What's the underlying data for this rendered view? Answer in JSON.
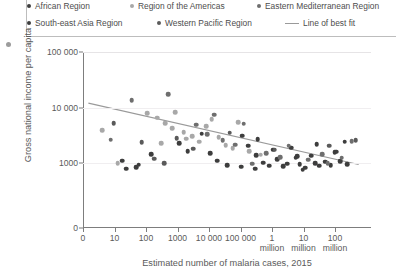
{
  "legend": {
    "items": [
      {
        "label": "African Region",
        "marker": "dot",
        "color": "#3d3d3d",
        "row": 0,
        "x": 0
      },
      {
        "label": "Region of the Americas",
        "marker": "dot",
        "color": "#a8a8a8",
        "row": 0,
        "x": 103
      },
      {
        "label": "Eastern Mediterranean Region",
        "marker": "dot",
        "color": "#6e6e6e",
        "row": 0,
        "x": 230
      },
      {
        "label": "South-east Asia Region",
        "marker": "dot",
        "color": "#3d3d3d",
        "row": 1,
        "x": 0
      },
      {
        "label": "Western Pacific Region",
        "marker": "dot",
        "color": "#5a5a5a",
        "row": 1,
        "x": 130
      },
      {
        "label": "Line of best fit",
        "marker": "line",
        "color": "#9a9a9a",
        "row": 1,
        "x": 258
      }
    ]
  },
  "chart_data": {
    "type": "scatter",
    "title": "",
    "xlabel": "Estimated number of malaria cases, 2015",
    "ylabel": "Gross national income per capita",
    "x_scale": "log",
    "y_scale": "log",
    "grid": true,
    "legend_position": "top",
    "x_ticks": [
      {
        "value": 0,
        "label": "0",
        "label2": ""
      },
      {
        "value": 10,
        "label": "10",
        "label2": ""
      },
      {
        "value": 100,
        "label": "100",
        "label2": ""
      },
      {
        "value": 1000,
        "label": "1000",
        "label2": ""
      },
      {
        "value": 10000,
        "label": "10 000",
        "label2": ""
      },
      {
        "value": 100000,
        "label": "100 000",
        "label2": ""
      },
      {
        "value": 1000000,
        "label": "1",
        "label2": "million"
      },
      {
        "value": 10000000,
        "label": "10",
        "label2": "million"
      },
      {
        "value": 100000000,
        "label": "100",
        "label2": "million"
      }
    ],
    "y_ticks": [
      {
        "value": 100000,
        "label": "100 000"
      },
      {
        "value": 10000,
        "label": "10 000"
      },
      {
        "value": 1000,
        "label": "1000"
      },
      {
        "value": 0,
        "label": "0"
      }
    ],
    "xlim": [
      0,
      100000000
    ],
    "ylim": [
      0,
      100000
    ],
    "line_of_best_fit": {
      "x0": 0.5,
      "y0": 12000,
      "x1": 97,
      "y1": 820,
      "color": "#9a9a9a"
    },
    "series": [
      {
        "name": "African Region",
        "color": "#3d3d3d",
        "points": [
          [
            12.5,
            1100
          ],
          [
            18.5,
            820
          ],
          [
            17.5,
            600
          ],
          [
            33.0,
            2300
          ],
          [
            44.0,
            1520
          ],
          [
            46.5,
            1100
          ],
          [
            50.0,
            780
          ],
          [
            55.0,
            610
          ],
          [
            57.5,
            2050
          ],
          [
            60.5,
            1380
          ],
          [
            63.0,
            1020
          ],
          [
            65.0,
            700
          ],
          [
            66.5,
            1750
          ],
          [
            68.0,
            1180
          ],
          [
            70.0,
            640
          ],
          [
            71.5,
            900
          ],
          [
            73.0,
            1900
          ],
          [
            74.5,
            1250
          ],
          [
            76.0,
            850
          ],
          [
            78.0,
            560
          ],
          [
            80.0,
            1350
          ],
          [
            81.5,
            980
          ],
          [
            83.0,
            700
          ],
          [
            85.0,
            1050
          ],
          [
            87.0,
            760
          ],
          [
            88.5,
            1550
          ],
          [
            90.5,
            1080
          ],
          [
            92.0,
            2400
          ],
          [
            60.0,
            480
          ],
          [
            77.0,
            430
          ],
          [
            55.5,
            3100
          ],
          [
            41.0,
            3400
          ]
        ]
      },
      {
        "name": "Region of the Americas",
        "color": "#a8a8a8",
        "points": [
          [
            5.5,
            3900
          ],
          [
            11.0,
            950
          ],
          [
            21.5,
            7800
          ],
          [
            25.0,
            6500
          ],
          [
            28.0,
            5200
          ],
          [
            30.5,
            4200
          ],
          [
            31.5,
            8200
          ],
          [
            34.5,
            3600
          ],
          [
            37.5,
            3050
          ],
          [
            40.0,
            2400
          ],
          [
            42.5,
            4600
          ],
          [
            47.0,
            2900
          ],
          [
            49.5,
            2100
          ],
          [
            52.0,
            1850
          ],
          [
            44.5,
            6200
          ],
          [
            35.5,
            2750
          ],
          [
            26.5,
            2300
          ],
          [
            58.0,
            1650
          ],
          [
            62.0,
            1400
          ],
          [
            54.0,
            5400
          ]
        ]
      },
      {
        "name": "Eastern Mediterranean Region",
        "color": "#6e6e6e",
        "points": [
          [
            8.5,
            2650
          ],
          [
            16.0,
            13500
          ],
          [
            29.0,
            17500
          ],
          [
            39.0,
            4900
          ],
          [
            43.0,
            3300
          ],
          [
            48.5,
            2600
          ],
          [
            53.0,
            2150
          ],
          [
            56.0,
            5100
          ],
          [
            64.0,
            1520
          ],
          [
            69.0,
            1280
          ],
          [
            72.0,
            2050
          ],
          [
            79.0,
            1150
          ],
          [
            84.0,
            1430
          ],
          [
            86.0,
            950
          ],
          [
            91.0,
            1250
          ],
          [
            94.5,
            2500
          ],
          [
            59.0,
            920
          ],
          [
            45.5,
            7400
          ]
        ]
      },
      {
        "name": "South-east Asia Region",
        "color": "#3d3d3d",
        "points": [
          [
            14.0,
            490
          ],
          [
            23.0,
            1450
          ],
          [
            36.0,
            1620
          ],
          [
            61.0,
            2700
          ],
          [
            75.0,
            1330
          ],
          [
            82.0,
            2180
          ],
          [
            89.0,
            1600
          ],
          [
            93.0,
            880
          ]
        ]
      },
      {
        "name": "Western Pacific Region",
        "color": "#5a5a5a",
        "points": [
          [
            9.5,
            5200
          ],
          [
            19.5,
            2350
          ],
          [
            24.0,
            1200
          ],
          [
            32.0,
            2800
          ],
          [
            38.0,
            1800
          ],
          [
            51.0,
            3500
          ],
          [
            67.0,
            1750
          ],
          [
            96.0,
            2550
          ],
          [
            27.5,
            960
          ],
          [
            86.5,
            2050
          ]
        ]
      }
    ]
  }
}
